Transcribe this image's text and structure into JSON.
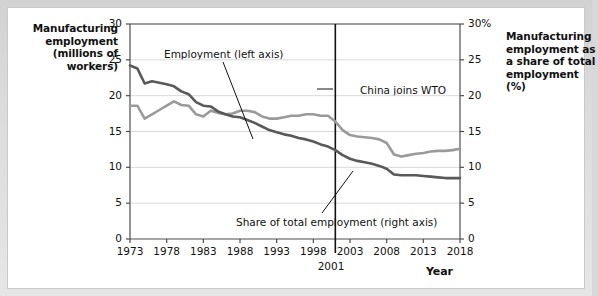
{
  "titles": {
    "left_axis_title": "Manufacturing employment (millions of workers)",
    "right_axis_title": "Manufacturing employment as a share of total employment (%)",
    "x_axis_title": "Year"
  },
  "annotations": {
    "employment": "Employment (left axis)",
    "share": "Share of total employment (right axis)",
    "wto": "China joins WTO",
    "wto_year": "2001"
  },
  "colors": {
    "employment_line": "#9a9a9a",
    "share_line": "#595959",
    "gridline": "#d9d9d9",
    "axis": "#4d4d4d",
    "page_background": "#d8d8d8",
    "card_background": "#ffffff",
    "text": "#111111"
  },
  "chart_data": {
    "type": "line",
    "title": "",
    "xlabel": "Year",
    "ylabel": "Manufacturing employment (millions of workers)",
    "y2label": "Manufacturing employment as a share of total employment (%)",
    "grid": true,
    "legend": "annotations",
    "xlim": [
      1973,
      2018
    ],
    "ylim": [
      0,
      30
    ],
    "y2lim": [
      0,
      30
    ],
    "ytick_labels": [
      "0",
      "5",
      "10",
      "15",
      "20",
      "25",
      "30"
    ],
    "ytick_values": [
      0,
      5,
      10,
      15,
      20,
      25,
      30
    ],
    "y2tick_labels": [
      "0",
      "5",
      "10",
      "15",
      "20",
      "25",
      "30%"
    ],
    "y2tick_values": [
      0,
      5,
      10,
      15,
      20,
      25,
      30
    ],
    "xtick_labels": [
      "1973",
      "1978",
      "1983",
      "1988",
      "1993",
      "1998",
      "2003",
      "2008",
      "2013",
      "2018"
    ],
    "xtick_values": [
      1973,
      1978,
      1983,
      1988,
      1993,
      1998,
      2003,
      2008,
      2013,
      2018
    ],
    "vline": {
      "x": 2001,
      "label": "China joins WTO"
    },
    "x": [
      1973,
      1974,
      1975,
      1976,
      1977,
      1978,
      1979,
      1980,
      1981,
      1982,
      1983,
      1984,
      1985,
      1986,
      1987,
      1988,
      1989,
      1990,
      1991,
      1992,
      1993,
      1994,
      1995,
      1996,
      1997,
      1998,
      1999,
      2000,
      2001,
      2002,
      2003,
      2004,
      2005,
      2006,
      2007,
      2008,
      2009,
      2010,
      2011,
      2012,
      2013,
      2014,
      2015,
      2016,
      2017,
      2018
    ],
    "series": [
      {
        "name": "Employment (left axis)",
        "axis": "left",
        "units": "millions of workers",
        "color": "#9a9a9a",
        "values": [
          18.6,
          18.6,
          16.8,
          17.4,
          18.0,
          18.6,
          19.2,
          18.7,
          18.6,
          17.4,
          17.1,
          17.9,
          17.6,
          17.4,
          17.5,
          17.9,
          17.9,
          17.7,
          17.1,
          16.8,
          16.8,
          17.0,
          17.2,
          17.2,
          17.4,
          17.4,
          17.2,
          17.2,
          16.4,
          15.2,
          14.5,
          14.3,
          14.2,
          14.1,
          13.9,
          13.4,
          11.8,
          11.5,
          11.7,
          11.9,
          12.0,
          12.2,
          12.3,
          12.3,
          12.4,
          12.6
        ]
      },
      {
        "name": "Share of total employment (right axis)",
        "axis": "right",
        "units": "percent",
        "color": "#595959",
        "values": [
          24.2,
          23.8,
          21.7,
          22.0,
          21.8,
          21.6,
          21.3,
          20.6,
          20.2,
          19.1,
          18.6,
          18.5,
          17.8,
          17.4,
          17.1,
          17.0,
          16.6,
          16.2,
          15.7,
          15.2,
          14.9,
          14.6,
          14.4,
          14.1,
          13.9,
          13.6,
          13.2,
          12.9,
          12.4,
          11.7,
          11.2,
          10.9,
          10.7,
          10.5,
          10.2,
          9.8,
          9.0,
          8.9,
          8.9,
          8.9,
          8.8,
          8.7,
          8.6,
          8.5,
          8.5,
          8.5
        ]
      }
    ]
  }
}
